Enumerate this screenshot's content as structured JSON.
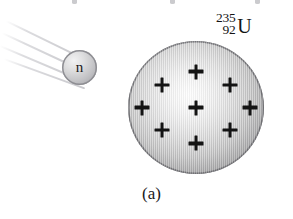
{
  "figure": {
    "caption": "(a)",
    "background_color": "#ffffff",
    "width": 293,
    "height": 219
  },
  "neutron": {
    "label": "n",
    "body_color": "#c2c2c5",
    "outline_color": "#8e8e93",
    "center_x": 79,
    "center_y": 67,
    "diameter": 35
  },
  "motion_trails": {
    "count": 4,
    "color": "#dcdcdf",
    "lines": [
      {
        "x": 6,
        "y": 2,
        "length": 84,
        "angle": 26
      },
      {
        "x": 2,
        "y": 14,
        "length": 88,
        "angle": 25
      },
      {
        "x": 0,
        "y": 27,
        "length": 90,
        "angle": 23
      },
      {
        "x": 4,
        "y": 40,
        "length": 86,
        "angle": 20
      }
    ]
  },
  "nucleus": {
    "center_x": 196,
    "center_y": 107,
    "diameter": 136,
    "body_color": "#c4c4c4",
    "outline_color": "#6f6f73",
    "protons": [
      {
        "x": 50,
        "y": 23
      },
      {
        "x": 50,
        "y": 50
      },
      {
        "x": 50,
        "y": 77
      },
      {
        "x": 25,
        "y": 33
      },
      {
        "x": 75,
        "y": 33
      },
      {
        "x": 10.5,
        "y": 50
      },
      {
        "x": 89.5,
        "y": 50
      },
      {
        "x": 25,
        "y": 67
      },
      {
        "x": 75,
        "y": 67
      }
    ],
    "proton_count": 9,
    "proton_symbol": "+"
  },
  "isotope_label": {
    "mass_number": "235",
    "atomic_number": "92",
    "symbol": "U",
    "full_text": "235-92-U"
  },
  "top_remnants": [
    {
      "x": 72
    },
    {
      "x": 170
    },
    {
      "x": 255
    }
  ]
}
